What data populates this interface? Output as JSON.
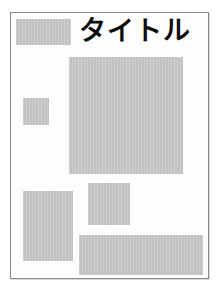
{
  "document": {
    "title_text": "タイトル",
    "frame": {
      "border_color": "#8a8a8a",
      "background_color": "#fdfdfd"
    },
    "placeholder_color": "#c2c2c2",
    "blocks": [
      {
        "id": "logo-placeholder",
        "label": "",
        "x": 5,
        "y": 6,
        "w": 55,
        "h": 26
      },
      {
        "id": "hero-image-placeholder",
        "label": "",
        "x": 58,
        "y": 44,
        "w": 114,
        "h": 117
      },
      {
        "id": "sidebar-thumb-placeholder",
        "label": "",
        "x": 12,
        "y": 85,
        "w": 26,
        "h": 27
      },
      {
        "id": "lower-left-placeholder",
        "label": "",
        "x": 12,
        "y": 178,
        "w": 50,
        "h": 70
      },
      {
        "id": "lower-mid-placeholder",
        "label": "",
        "x": 77,
        "y": 170,
        "w": 42,
        "h": 42
      },
      {
        "id": "footer-bar-placeholder",
        "label": "",
        "x": 68,
        "y": 222,
        "w": 124,
        "h": 40
      }
    ]
  }
}
